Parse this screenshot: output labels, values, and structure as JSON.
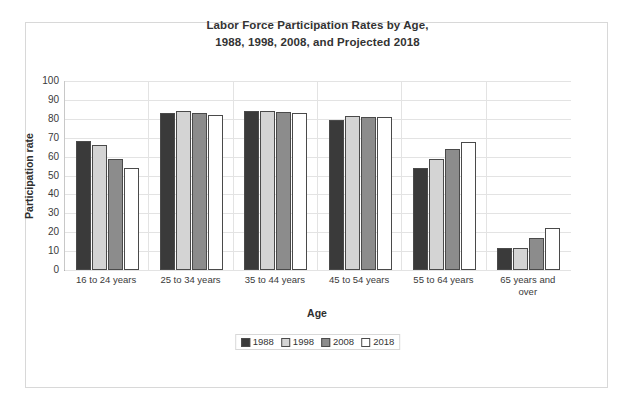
{
  "chart_data": {
    "type": "bar",
    "title": "Labor Force Participation Rates by Age, 1988, 1998, 2008, and Projected 2018",
    "title_lines": [
      "Labor Force Participation Rates by Age,",
      "1988, 1998, 2008, and Projected 2018"
    ],
    "xlabel": "Age",
    "ylabel": "Participation rate",
    "ylim": [
      0,
      100
    ],
    "ytick_step": 10,
    "yticks": [
      100,
      90,
      80,
      70,
      60,
      50,
      40,
      30,
      20,
      10,
      0
    ],
    "grid": true,
    "legend_position": "bottom",
    "categories": [
      "16 to 24 years",
      "25 to 34 years",
      "35 to 44 years",
      "45 to 54 years",
      "55 to 64 years",
      "65 years and over"
    ],
    "category_lines": [
      [
        "16 to 24 years"
      ],
      [
        "25 to 34 years"
      ],
      [
        "35 to 44 years"
      ],
      [
        "45 to 54 years"
      ],
      [
        "55 to 64 years"
      ],
      [
        "65 years and",
        "over"
      ]
    ],
    "series": [
      {
        "name": "1988",
        "color": "#3a3a3a",
        "values": [
          68.5,
          83.1,
          84.3,
          79.2,
          54.2,
          11.5
        ]
      },
      {
        "name": "1998",
        "color": "#d4d4d4",
        "values": [
          66.0,
          84.3,
          84.3,
          81.6,
          58.8,
          11.9
        ]
      },
      {
        "name": "2008",
        "color": "#8c8c8c",
        "values": [
          58.8,
          83.0,
          83.5,
          81.2,
          64.0,
          16.8
        ]
      },
      {
        "name": "2018",
        "color": "#ffffff",
        "values": [
          54.2,
          82.2,
          82.9,
          81.0,
          67.8,
          22.4
        ]
      }
    ]
  },
  "style": {
    "bar_outline": "#4a4a4a",
    "gridline_color": "#e3e3e3",
    "frame_color": "#d8d8d8",
    "axis_color": "#9a9a9a",
    "text_color": "#333333",
    "background": "#ffffff"
  }
}
